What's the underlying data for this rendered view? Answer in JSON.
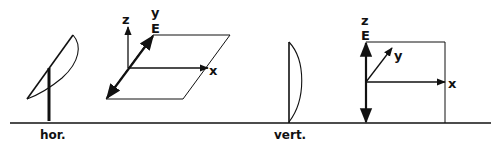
{
  "diagram": {
    "type": "antenna-polarization",
    "colors": {
      "ink": "#111111",
      "background": "#ffffff"
    },
    "panels": [
      {
        "id": "horizontal",
        "caption": "hor.",
        "antenna": "tilted dish on mast",
        "axes": {
          "z": "z",
          "y": "y",
          "x": "x",
          "field": "E"
        },
        "field_plane": "horizontal parallelogram (xy-plane)",
        "field_direction": "along y"
      },
      {
        "id": "vertical",
        "caption": "vert.",
        "antenna": "vertical dish",
        "axes": {
          "z": "z",
          "y": "y",
          "x": "x",
          "field": "E"
        },
        "field_plane": "vertical rectangle (xz-plane)",
        "field_direction": "along z"
      }
    ]
  }
}
